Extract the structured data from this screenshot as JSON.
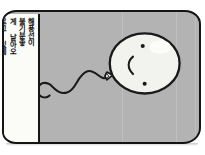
{
  "panel": {
    "kind": "comic-panel",
    "background_color": "#b3b3b3",
    "border_color": "#141414",
    "corner_radius_px": 15
  },
  "caption": {
    "box_color": "#fbfbf8",
    "text_color": "#141414",
    "orientation": "vertical-right-to-left",
    "lines": [
      "해 풍선이",
      "불 기분좋",
      "풍선이 날아",
      "이 기분",
      "좋게 날아",
      "오르고 있네"
    ],
    "text": "해풍선이\n불기분좋\n게 날아오\n르고 있네"
  },
  "balloon": {
    "fill_color": "#f2f2ee",
    "outline_color": "#1a1a1a",
    "knot_label": "balloon-knot",
    "string_label": "balloon-string",
    "face": {
      "eye_dot_upper": "•",
      "eye_dot_lower": "•",
      "mouth_glyph": "("
    }
  },
  "colors": {
    "ink": "#141414",
    "panel_gray": "#b3b3b3",
    "paper_white": "#fbfbf8",
    "balloon_white": "#f2f2ee"
  }
}
